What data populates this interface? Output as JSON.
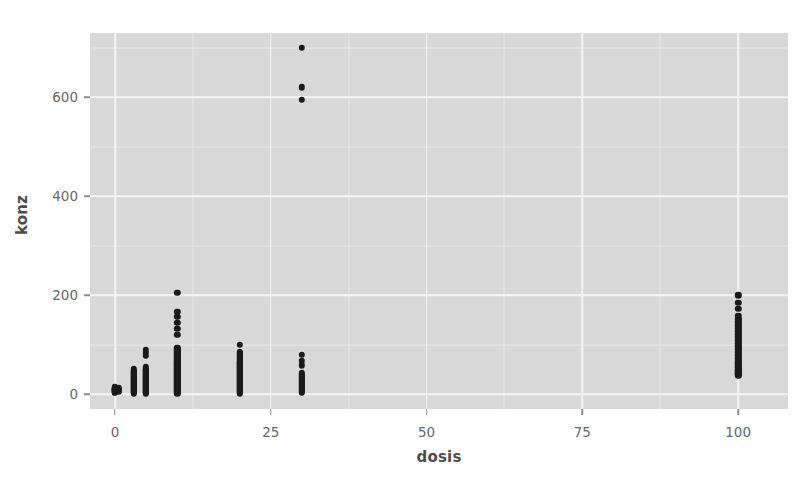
{
  "chart_data": {
    "type": "scatter",
    "title": "",
    "xlabel": "dosis",
    "ylabel": "konz",
    "xlim": [
      -4,
      108
    ],
    "ylim": [
      -30,
      730
    ],
    "xticks": [
      0,
      25,
      50,
      75,
      100
    ],
    "xtick_labels": [
      "0",
      "25",
      "50",
      "75",
      "100"
    ],
    "yticks": [
      0,
      200,
      400,
      600
    ],
    "ytick_labels": [
      "0",
      "200",
      "400",
      "600"
    ],
    "x_minor_ticks": [
      12.5,
      37.5,
      62.5,
      87.5
    ],
    "y_minor_ticks": [
      100,
      300,
      500,
      700
    ],
    "grid": true,
    "legend": "none",
    "panel_background": "#d8d8d8",
    "grid_major_color": "#f4f4f4",
    "grid_minor_color": "#e8e8e8",
    "point_color": "#1a1a1a",
    "point_size": 6.4,
    "series": [
      {
        "name": "konz vs dosis",
        "points": [
          [
            0,
            4
          ],
          [
            0,
            6
          ],
          [
            0,
            8
          ],
          [
            0,
            10
          ],
          [
            0,
            12
          ],
          [
            0,
            5
          ],
          [
            0,
            7
          ],
          [
            0,
            9
          ],
          [
            0,
            11
          ],
          [
            0,
            13
          ],
          [
            0,
            3
          ],
          [
            0,
            14
          ],
          [
            0,
            6
          ],
          [
            0,
            8
          ],
          [
            0,
            10
          ],
          [
            0.6,
            5
          ],
          [
            0.6,
            9
          ],
          [
            0.6,
            12
          ],
          [
            0.6,
            7
          ],
          [
            3,
            2
          ],
          [
            3,
            6
          ],
          [
            3,
            10
          ],
          [
            3,
            14
          ],
          [
            3,
            18
          ],
          [
            3,
            22
          ],
          [
            3,
            26
          ],
          [
            3,
            30
          ],
          [
            3,
            34
          ],
          [
            3,
            38
          ],
          [
            3,
            42
          ],
          [
            3,
            46
          ],
          [
            3,
            50
          ],
          [
            3,
            8
          ],
          [
            3,
            16
          ],
          [
            3,
            24
          ],
          [
            3,
            32
          ],
          [
            3,
            40
          ],
          [
            3,
            12
          ],
          [
            3,
            20
          ],
          [
            3,
            28
          ],
          [
            3,
            36
          ],
          [
            3,
            44
          ],
          [
            3,
            4
          ],
          [
            5,
            2
          ],
          [
            5,
            6
          ],
          [
            5,
            10
          ],
          [
            5,
            14
          ],
          [
            5,
            18
          ],
          [
            5,
            22
          ],
          [
            5,
            26
          ],
          [
            5,
            30
          ],
          [
            5,
            34
          ],
          [
            5,
            38
          ],
          [
            5,
            42
          ],
          [
            5,
            46
          ],
          [
            5,
            50
          ],
          [
            5,
            54
          ],
          [
            5,
            8
          ],
          [
            5,
            16
          ],
          [
            5,
            24
          ],
          [
            5,
            32
          ],
          [
            5,
            40
          ],
          [
            5,
            48
          ],
          [
            5,
            12
          ],
          [
            5,
            20
          ],
          [
            5,
            28
          ],
          [
            5,
            36
          ],
          [
            5,
            44
          ],
          [
            5,
            4
          ],
          [
            5,
            78
          ],
          [
            5,
            84
          ],
          [
            5,
            90
          ],
          [
            10,
            2
          ],
          [
            10,
            6
          ],
          [
            10,
            10
          ],
          [
            10,
            14
          ],
          [
            10,
            18
          ],
          [
            10,
            22
          ],
          [
            10,
            26
          ],
          [
            10,
            30
          ],
          [
            10,
            34
          ],
          [
            10,
            38
          ],
          [
            10,
            42
          ],
          [
            10,
            46
          ],
          [
            10,
            50
          ],
          [
            10,
            54
          ],
          [
            10,
            58
          ],
          [
            10,
            62
          ],
          [
            10,
            66
          ],
          [
            10,
            70
          ],
          [
            10,
            74
          ],
          [
            10,
            78
          ],
          [
            10,
            82
          ],
          [
            10,
            86
          ],
          [
            10,
            90
          ],
          [
            10,
            94
          ],
          [
            10,
            4
          ],
          [
            10,
            12
          ],
          [
            10,
            20
          ],
          [
            10,
            28
          ],
          [
            10,
            36
          ],
          [
            10,
            44
          ],
          [
            10,
            52
          ],
          [
            10,
            60
          ],
          [
            10,
            68
          ],
          [
            10,
            76
          ],
          [
            10,
            84
          ],
          [
            10,
            92
          ],
          [
            10,
            8
          ],
          [
            10,
            16
          ],
          [
            10,
            24
          ],
          [
            10,
            32
          ],
          [
            10,
            40
          ],
          [
            10,
            48
          ],
          [
            10,
            56
          ],
          [
            10,
            64
          ],
          [
            10,
            72
          ],
          [
            10,
            80
          ],
          [
            10,
            88
          ],
          [
            10,
            120
          ],
          [
            10,
            132
          ],
          [
            10,
            144
          ],
          [
            10,
            156
          ],
          [
            10,
            166
          ],
          [
            10,
            205
          ],
          [
            20,
            2
          ],
          [
            20,
            6
          ],
          [
            20,
            10
          ],
          [
            20,
            14
          ],
          [
            20,
            18
          ],
          [
            20,
            22
          ],
          [
            20,
            26
          ],
          [
            20,
            30
          ],
          [
            20,
            34
          ],
          [
            20,
            38
          ],
          [
            20,
            42
          ],
          [
            20,
            46
          ],
          [
            20,
            50
          ],
          [
            20,
            54
          ],
          [
            20,
            58
          ],
          [
            20,
            62
          ],
          [
            20,
            66
          ],
          [
            20,
            70
          ],
          [
            20,
            74
          ],
          [
            20,
            78
          ],
          [
            20,
            82
          ],
          [
            20,
            86
          ],
          [
            20,
            4
          ],
          [
            20,
            12
          ],
          [
            20,
            20
          ],
          [
            20,
            28
          ],
          [
            20,
            36
          ],
          [
            20,
            44
          ],
          [
            20,
            52
          ],
          [
            20,
            60
          ],
          [
            20,
            68
          ],
          [
            20,
            76
          ],
          [
            20,
            84
          ],
          [
            20,
            8
          ],
          [
            20,
            16
          ],
          [
            20,
            24
          ],
          [
            20,
            32
          ],
          [
            20,
            40
          ],
          [
            20,
            48
          ],
          [
            20,
            56
          ],
          [
            20,
            64
          ],
          [
            20,
            72
          ],
          [
            20,
            80
          ],
          [
            20,
            100
          ],
          [
            30,
            6
          ],
          [
            30,
            12
          ],
          [
            30,
            18
          ],
          [
            30,
            24
          ],
          [
            30,
            30
          ],
          [
            30,
            36
          ],
          [
            30,
            42
          ],
          [
            30,
            9
          ],
          [
            30,
            15
          ],
          [
            30,
            21
          ],
          [
            30,
            27
          ],
          [
            30,
            33
          ],
          [
            30,
            39
          ],
          [
            30,
            3
          ],
          [
            30,
            58
          ],
          [
            30,
            68
          ],
          [
            30,
            80
          ],
          [
            30,
            595
          ],
          [
            30,
            620
          ],
          [
            30,
            700
          ],
          [
            100,
            38
          ],
          [
            100,
            42
          ],
          [
            100,
            46
          ],
          [
            100,
            50
          ],
          [
            100,
            56
          ],
          [
            100,
            62
          ],
          [
            100,
            68
          ],
          [
            100,
            74
          ],
          [
            100,
            80
          ],
          [
            100,
            86
          ],
          [
            100,
            92
          ],
          [
            100,
            98
          ],
          [
            100,
            104
          ],
          [
            100,
            110
          ],
          [
            100,
            116
          ],
          [
            100,
            122
          ],
          [
            100,
            128
          ],
          [
            100,
            134
          ],
          [
            100,
            140
          ],
          [
            100,
            146
          ],
          [
            100,
            152
          ],
          [
            100,
            158
          ],
          [
            100,
            40
          ],
          [
            100,
            44
          ],
          [
            100,
            48
          ],
          [
            100,
            54
          ],
          [
            100,
            60
          ],
          [
            100,
            66
          ],
          [
            100,
            72
          ],
          [
            100,
            78
          ],
          [
            100,
            84
          ],
          [
            100,
            90
          ],
          [
            100,
            96
          ],
          [
            100,
            102
          ],
          [
            100,
            108
          ],
          [
            100,
            114
          ],
          [
            100,
            120
          ],
          [
            100,
            126
          ],
          [
            100,
            132
          ],
          [
            100,
            138
          ],
          [
            100,
            144
          ],
          [
            100,
            150
          ],
          [
            100,
            172
          ],
          [
            100,
            185
          ],
          [
            100,
            200
          ]
        ]
      }
    ]
  }
}
